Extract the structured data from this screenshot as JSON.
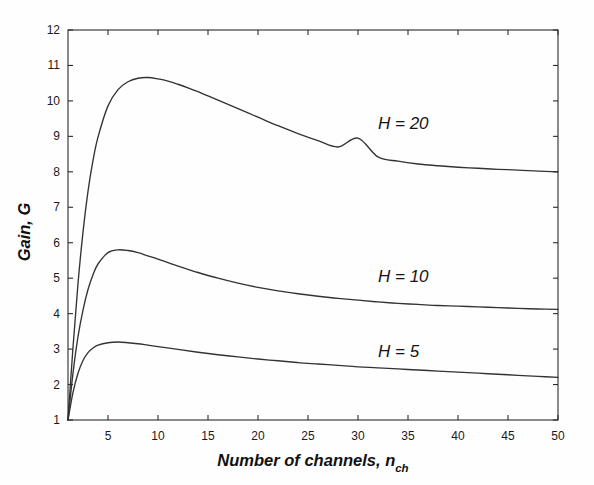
{
  "chart_data": {
    "type": "line",
    "title": "",
    "xlabel": "Number of channels, n_ch",
    "xlabel_main": "Number of channels, n",
    "xlabel_sub": "ch",
    "ylabel": "Gain, G",
    "xlim": [
      1,
      50
    ],
    "ylim": [
      1,
      12
    ],
    "xticks": [
      5,
      10,
      15,
      20,
      25,
      30,
      35,
      40,
      45,
      50
    ],
    "xtick_labels": [
      "5",
      "10",
      "15",
      "20",
      "25",
      "30",
      "35",
      "40",
      "45",
      "50"
    ],
    "yticks": [
      1,
      2,
      3,
      4,
      5,
      6,
      7,
      8,
      9,
      10,
      11,
      12
    ],
    "ytick_labels": [
      "1",
      "2",
      "3",
      "4",
      "5",
      "6",
      "7",
      "8",
      "9",
      "10",
      "11",
      "12"
    ],
    "grid": false,
    "legend": "inline-annotations",
    "line_color": "#333333",
    "axis_color": "#2b2b2b",
    "background": "#fefefe",
    "series": [
      {
        "name": "H = 20",
        "label": "H = 20",
        "label_x": 32,
        "label_y": 9.2,
        "H": 20,
        "x": [
          1,
          1.5,
          2,
          2.5,
          3,
          3.5,
          4,
          5,
          6,
          7,
          8,
          9,
          10,
          11,
          12,
          13,
          14,
          15,
          16,
          18,
          20,
          22,
          24,
          26,
          28,
          30,
          32,
          34,
          36,
          38,
          40,
          42,
          44,
          46,
          48,
          50
        ],
        "values": [
          1.0,
          3.05,
          4.85,
          6.3,
          7.45,
          8.32,
          8.98,
          9.86,
          10.32,
          10.54,
          10.64,
          10.66,
          10.62,
          10.56,
          10.47,
          10.37,
          10.26,
          10.14,
          10.02,
          9.78,
          9.54,
          9.3,
          9.08,
          8.88,
          8.7,
          8.95,
          8.42,
          8.3,
          8.22,
          8.17,
          8.13,
          8.1,
          8.07,
          8.05,
          8.02,
          8.0
        ]
      },
      {
        "name": "H = 10",
        "label": "H = 10",
        "label_x": 32,
        "label_y": 4.9,
        "H": 10,
        "x": [
          1,
          1.5,
          2,
          2.5,
          3,
          3.5,
          4,
          5,
          6,
          7,
          8,
          9,
          10,
          11,
          12,
          13,
          14,
          16,
          18,
          20,
          22,
          24,
          26,
          28,
          30,
          32,
          34,
          36,
          38,
          40,
          42,
          44,
          46,
          48,
          50
        ],
        "values": [
          1.0,
          2.32,
          3.35,
          4.1,
          4.68,
          5.1,
          5.4,
          5.72,
          5.8,
          5.78,
          5.72,
          5.63,
          5.54,
          5.44,
          5.34,
          5.25,
          5.16,
          5.0,
          4.86,
          4.74,
          4.64,
          4.56,
          4.49,
          4.43,
          4.38,
          4.33,
          4.29,
          4.26,
          4.23,
          4.21,
          4.19,
          4.17,
          4.15,
          4.13,
          4.12
        ]
      },
      {
        "name": "H = 5",
        "label": "H = 5",
        "label_x": 32,
        "label_y": 2.78,
        "H": 5,
        "x": [
          1,
          1.5,
          2,
          2.5,
          3,
          3.5,
          4,
          5,
          6,
          7,
          8,
          9,
          10,
          12,
          14,
          16,
          18,
          20,
          22,
          24,
          26,
          28,
          30,
          32,
          34,
          36,
          38,
          40,
          42,
          44,
          46,
          48,
          50
        ],
        "values": [
          1.0,
          1.78,
          2.32,
          2.68,
          2.9,
          3.03,
          3.11,
          3.18,
          3.2,
          3.18,
          3.15,
          3.11,
          3.07,
          2.99,
          2.91,
          2.84,
          2.78,
          2.72,
          2.67,
          2.62,
          2.58,
          2.54,
          2.5,
          2.47,
          2.44,
          2.41,
          2.38,
          2.35,
          2.32,
          2.29,
          2.26,
          2.23,
          2.2
        ]
      }
    ]
  },
  "figure": {
    "annotations": [
      "H = 20",
      "H = 10",
      "H = 5"
    ]
  }
}
